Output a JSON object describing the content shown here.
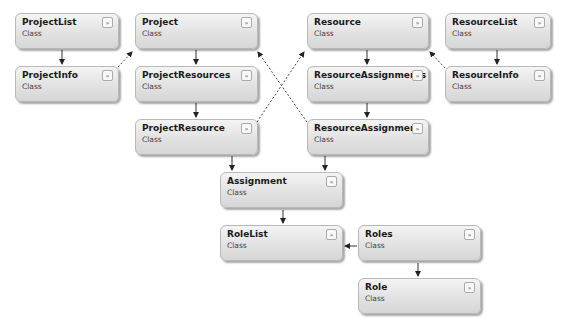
{
  "diagram": {
    "kind_label": "Class",
    "expand_glyph": "»",
    "classes": [
      {
        "id": "ProjectList",
        "name": "ProjectList"
      },
      {
        "id": "ProjectInfo",
        "name": "ProjectInfo"
      },
      {
        "id": "Project",
        "name": "Project"
      },
      {
        "id": "ProjectResources",
        "name": "ProjectResources"
      },
      {
        "id": "ProjectResource",
        "name": "ProjectResource"
      },
      {
        "id": "Resource",
        "name": "Resource"
      },
      {
        "id": "ResourceAssignments",
        "name": "ResourceAssignments"
      },
      {
        "id": "ResourceAssignment",
        "name": "ResourceAssignment"
      },
      {
        "id": "ResourceList",
        "name": "ResourceList"
      },
      {
        "id": "ResourceInfo",
        "name": "ResourceInfo"
      },
      {
        "id": "Assignment",
        "name": "Assignment"
      },
      {
        "id": "RoleList",
        "name": "RoleList"
      },
      {
        "id": "Roles",
        "name": "Roles"
      },
      {
        "id": "Role",
        "name": "Role"
      }
    ],
    "relations": [
      {
        "from": "ProjectList",
        "to": "ProjectInfo",
        "style": "solid"
      },
      {
        "from": "ProjectInfo",
        "to": "Project",
        "style": "dashed"
      },
      {
        "from": "Project",
        "to": "ProjectResources",
        "style": "solid"
      },
      {
        "from": "ProjectResources",
        "to": "ProjectResource",
        "style": "solid"
      },
      {
        "from": "ProjectResource",
        "to": "Resource",
        "style": "dashed"
      },
      {
        "from": "ResourceAssignment",
        "to": "Project",
        "style": "dashed"
      },
      {
        "from": "Resource",
        "to": "ResourceAssignments",
        "style": "solid"
      },
      {
        "from": "ResourceAssignments",
        "to": "ResourceAssignment",
        "style": "solid"
      },
      {
        "from": "ResourceList",
        "to": "ResourceInfo",
        "style": "solid"
      },
      {
        "from": "ResourceInfo",
        "to": "Resource",
        "style": "dashed"
      },
      {
        "from": "ProjectResource",
        "to": "Assignment",
        "style": "solid"
      },
      {
        "from": "ResourceAssignment",
        "to": "Assignment",
        "style": "solid"
      },
      {
        "from": "Assignment",
        "to": "RoleList",
        "style": "solid"
      },
      {
        "from": "Roles",
        "to": "RoleList",
        "style": "solid"
      },
      {
        "from": "Roles",
        "to": "Role",
        "style": "solid"
      }
    ]
  }
}
